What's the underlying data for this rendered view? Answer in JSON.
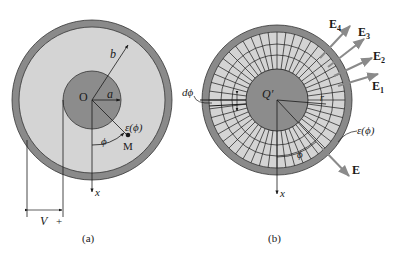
{
  "figure_a": {
    "caption": "(a)",
    "center_label": "O",
    "inner_radius_label": "a",
    "outer_radius_label": "b",
    "permittivity_label": "ε(ϕ)",
    "point_label": "M",
    "angle_label": "ϕ",
    "axis_label": "x",
    "voltage_label": "V",
    "plus_sign": "+"
  },
  "figure_b": {
    "caption": "(b)",
    "charge_label": "Q′",
    "radius_label": "r",
    "dphi_label": "dϕ",
    "permittivity_label": "ε(ϕ)",
    "angle_label": "ϕ",
    "axis_label": "x",
    "field_label": "E",
    "field_vectors": [
      {
        "label": "E",
        "sub": "4"
      },
      {
        "label": "E",
        "sub": "3"
      },
      {
        "label": "E",
        "sub": "2"
      },
      {
        "label": "E",
        "sub": "1"
      }
    ]
  },
  "colors": {
    "shell": "#8a8a8a",
    "dielectric": "#d4d4d4",
    "core": "#8c8c8c",
    "line": "#1a1a1a",
    "arrow": "#8a8a8a"
  }
}
